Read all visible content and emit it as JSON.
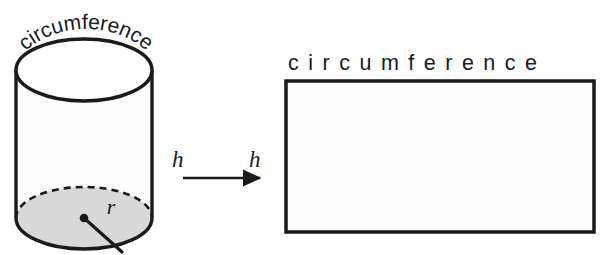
{
  "figure": {
    "background_color": "#ffffff",
    "stroke_color": "#1a1a1a",
    "shaded_fill_color": "#d8d8d8",
    "body_fill_color": "#fdfdfd"
  },
  "cylinder": {
    "curved_label": "circumference",
    "curved_label_chars": [
      "c",
      "i",
      "r",
      "c",
      "u",
      "m",
      "f",
      "e",
      "r",
      "e",
      "n",
      "c",
      "e"
    ],
    "radius_label": "r",
    "height_label": "h",
    "top_ellipse": {
      "cx": 84,
      "cy": 70,
      "rx": 68,
      "ry": 31
    },
    "bottom_ellipse": {
      "cx": 84,
      "cy": 218,
      "rx": 68,
      "ry": 31
    },
    "side_left_x": 16,
    "side_right_x": 152,
    "radius_line": {
      "x1": 84,
      "y1": 218,
      "x2": 122,
      "y2": 252
    }
  },
  "arrow": {
    "label_left": "h",
    "label_right": "h",
    "x_start": 183,
    "x_end": 262,
    "y": 178
  },
  "rectangle": {
    "top_label": "circumference",
    "x": 286,
    "y": 81,
    "width": 308,
    "height": 151,
    "fill": "#fdfdfd",
    "stroke_width": 3.5
  }
}
